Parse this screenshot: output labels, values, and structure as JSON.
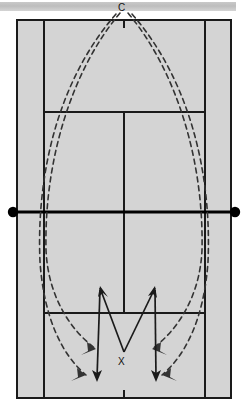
{
  "diagram": {
    "kind": "tennis-court-drill-diagram",
    "title_banner": {
      "visible": true,
      "color": "#c4c4c4"
    },
    "court": {
      "surface_color": "#d4d4d4",
      "line_color": "#1a1a1a",
      "outer_left_x": 17,
      "outer_right_x": 231,
      "top_baseline_y": 20,
      "bottom_baseline_y": 398,
      "singles_left_x": 44,
      "singles_right_x": 205,
      "top_service_line_y": 112,
      "bottom_service_line_y": 313,
      "center_service_line_x": 124,
      "net_y": 212
    },
    "net": {
      "post_color": "#000000",
      "left_post_x": 13,
      "right_post_x": 235,
      "post_radius": 5
    },
    "labels": [
      {
        "name": "coach-label",
        "text": "C",
        "x": 118,
        "y": 4
      },
      {
        "name": "player-label",
        "text": "X",
        "x": 118,
        "y": 357
      }
    ],
    "feeds": {
      "style": "dashed",
      "color": "#333333",
      "description": "four dashed ball-feed trajectories arcing from C over the net into the far court",
      "count": 4
    },
    "player_paths": {
      "style": "solid",
      "color": "#1a1a1a",
      "description": "two solid diagonal arrows from X crossing outward, and two solid vertical arrows running back",
      "count": 4
    }
  }
}
